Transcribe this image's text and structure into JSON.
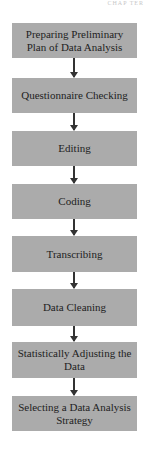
{
  "diagram": {
    "type": "flowchart",
    "direction": "top-to-bottom",
    "header_fragment": "CHAP TER",
    "colors": {
      "box_fill": "#ababab",
      "text": "#1e1e1e",
      "arrow": "#333333",
      "background": "#ffffff"
    },
    "steps": [
      {
        "label": "Preparing Preliminary Plan of Data Analysis"
      },
      {
        "label": "Questionnaire Checking"
      },
      {
        "label": "Editing"
      },
      {
        "label": "Coding"
      },
      {
        "label": "Transcribing"
      },
      {
        "label": "Data Cleaning"
      },
      {
        "label": "Statistically Adjusting the Data"
      },
      {
        "label": "Selecting a Data Analysis Strategy"
      }
    ],
    "edges": [
      {
        "from": 0,
        "to": 1
      },
      {
        "from": 1,
        "to": 2
      },
      {
        "from": 2,
        "to": 3
      },
      {
        "from": 3,
        "to": 4
      },
      {
        "from": 4,
        "to": 5
      },
      {
        "from": 5,
        "to": 6
      },
      {
        "from": 6,
        "to": 7
      }
    ]
  }
}
